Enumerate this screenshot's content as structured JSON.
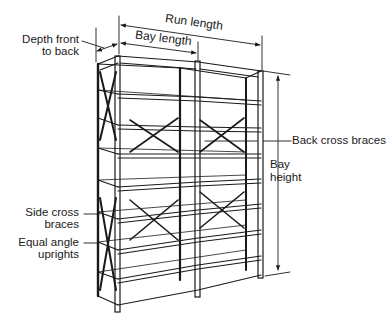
{
  "diagram": {
    "labels": {
      "run_length": "Run length",
      "bay_length": "Bay length",
      "depth_line1": "Depth front",
      "depth_line2": "to back",
      "back_cross_braces": "Back cross braces",
      "bay_height_line1": "Bay",
      "bay_height_line2": "height",
      "side_cross_line1": "Side cross",
      "side_cross_line2": "braces",
      "equal_angle_line1": "Equal angle",
      "equal_angle_line2": "uprights"
    },
    "bays": 2,
    "shelf_levels": 8,
    "colors": {
      "ink": "#1a1a1a",
      "background": "#ffffff"
    }
  }
}
